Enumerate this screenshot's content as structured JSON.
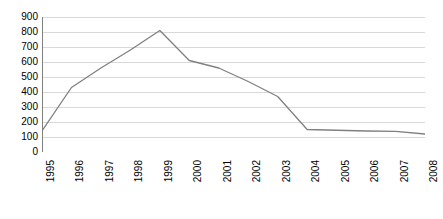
{
  "chart_data": {
    "type": "line",
    "title": "",
    "subtitle": "",
    "xlabel": "",
    "ylabel": "",
    "categories": [
      "1995",
      "1996",
      "1997",
      "1998",
      "1999",
      "2000",
      "2001",
      "2002",
      "2003",
      "2004",
      "2005",
      "2006",
      "2007",
      "2008"
    ],
    "values": [
      140,
      430,
      560,
      680,
      810,
      610,
      560,
      470,
      370,
      150,
      145,
      140,
      138,
      120
    ],
    "series": [
      {
        "name": "",
        "values": [
          140,
          430,
          560,
          680,
          810,
          610,
          560,
          470,
          370,
          150,
          145,
          140,
          138,
          120
        ]
      }
    ],
    "ylim": [
      0,
      900
    ],
    "ytick_step": 100,
    "ytick_labels": [
      "900",
      "800",
      "700",
      "600",
      "500",
      "400",
      "300",
      "200",
      "100",
      "0"
    ],
    "ytick_values": [
      900,
      800,
      700,
      600,
      500,
      400,
      300,
      200,
      100,
      0
    ],
    "grid": true,
    "grid_axis": "y",
    "legend": false,
    "legend_position": "none",
    "markers": false,
    "annotations": [],
    "colors": {
      "line": "#808080",
      "grid": "#d9d9d9",
      "axis": "#808080",
      "background": "#ffffff",
      "text": "#000000"
    }
  }
}
